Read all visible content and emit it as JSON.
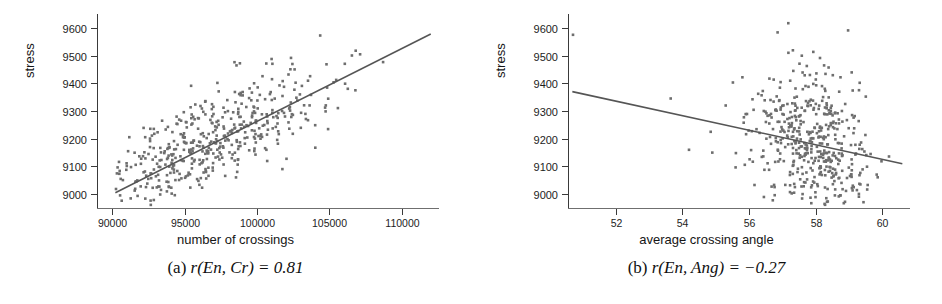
{
  "figure": {
    "panels": [
      {
        "id": "a",
        "caption_prefix": "(a)",
        "caption_math": "r(En, Cr) = 0.81",
        "caption_full": "(a) r(En, Cr) = 0.81"
      },
      {
        "id": "b",
        "caption_prefix": "(b)",
        "caption_math": "r(En, Ang) = −0.27",
        "caption_full": "(b) r(En, Ang) = −0.27"
      }
    ]
  },
  "chart_data": [
    {
      "type": "scatter",
      "panel": "a",
      "title": "",
      "xlabel": "number of crossings",
      "ylabel": "stress",
      "xlim": [
        89000,
        112500
      ],
      "ylim": [
        8950,
        9650
      ],
      "xticks": [
        90000,
        95000,
        100000,
        105000,
        110000
      ],
      "xticklabels": [
        "90000",
        "95000",
        "100000",
        "105000",
        "110000"
      ],
      "yticks": [
        9000,
        9100,
        9200,
        9300,
        9400,
        9500,
        9600
      ],
      "yticklabels": [
        "9000",
        "9100",
        "9200",
        "9300",
        "9400",
        "9500",
        "9600"
      ],
      "grid": false,
      "legend": null,
      "correlation": 0.81,
      "trendline": {
        "x": [
          90200,
          112000
        ],
        "y": [
          9005,
          9578
        ],
        "color": "#555555"
      },
      "marker": {
        "shape": "square",
        "size": 2.6,
        "color": "#6e6e6e"
      },
      "n_points": 470,
      "cluster": {
        "x_mean": 96500,
        "x_std": 4200,
        "y_mean": 9180,
        "y_std": 135,
        "corr": 0.81,
        "x_min": 90200,
        "x_max": 112000,
        "y_min": 8960,
        "y_max": 9620
      }
    },
    {
      "type": "scatter",
      "panel": "b",
      "title": "",
      "xlabel": "average crossing angle",
      "ylabel": "stress",
      "xlim": [
        50.6,
        60.8
      ],
      "ylim": [
        8950,
        9650
      ],
      "xticks": [
        52,
        54,
        56,
        58,
        60
      ],
      "xticklabels": [
        "52",
        "54",
        "56",
        "58",
        "60"
      ],
      "yticks": [
        9000,
        9100,
        9200,
        9300,
        9400,
        9500,
        9600
      ],
      "yticklabels": [
        "9000",
        "9100",
        "9200",
        "9300",
        "9400",
        "9500",
        "9600"
      ],
      "grid": false,
      "legend": null,
      "correlation": -0.27,
      "trendline": {
        "x": [
          50.7,
          60.6
        ],
        "y": [
          9370,
          9110
        ],
        "color": "#555555"
      },
      "marker": {
        "shape": "square",
        "size": 2.6,
        "color": "#6e6e6e"
      },
      "n_points": 470,
      "cluster": {
        "x_mean": 58.0,
        "x_std": 0.85,
        "y_mean": 9170,
        "y_std": 140,
        "corr": -0.27,
        "x_min": 55.3,
        "x_max": 60.4,
        "y_min": 8960,
        "y_max": 9620
      },
      "outliers": [
        {
          "x": 50.72,
          "y": 9575
        },
        {
          "x": 53.65,
          "y": 9345
        },
        {
          "x": 54.2,
          "y": 9160
        },
        {
          "x": 54.85,
          "y": 9225
        },
        {
          "x": 54.9,
          "y": 9150
        },
        {
          "x": 55.3,
          "y": 9320
        }
      ]
    }
  ]
}
